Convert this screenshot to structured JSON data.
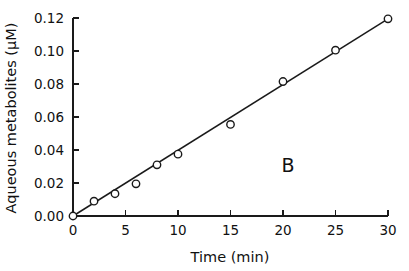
{
  "figure": {
    "panel_label": "B",
    "background_color": "#ffffff",
    "ink_color": "#1a1a1a"
  },
  "chart_data": {
    "type": "scatter",
    "title": "",
    "subtitle": "",
    "xlabel": "Time (min)",
    "ylabel": "Aqueous metabolites (µM)",
    "xlim": [
      0,
      30
    ],
    "ylim": [
      0.0,
      0.12
    ],
    "xticks": [
      0,
      5,
      10,
      15,
      20,
      25,
      30
    ],
    "xticklabels": [
      "0",
      "5",
      "10",
      "15",
      "20",
      "25",
      "30"
    ],
    "yticks": [
      0.0,
      0.02,
      0.04,
      0.06,
      0.08,
      0.1,
      0.12
    ],
    "yticklabels": [
      "0.00",
      "0.02",
      "0.04",
      "0.06",
      "0.08",
      "0.10",
      "0.12"
    ],
    "grid": false,
    "legend": false,
    "legend_position": "none",
    "annotations": [
      {
        "text": "B",
        "x": 22.5,
        "y": 0.0375
      }
    ],
    "series": [
      {
        "name": "Aqueous metabolites",
        "marker": "open-circle",
        "marker_size": 5,
        "color": "#1a1a1a",
        "x": [
          0,
          2,
          4,
          6,
          8,
          10,
          15,
          20,
          25,
          30
        ],
        "values": [
          0.0,
          0.009,
          0.0135,
          0.0195,
          0.031,
          0.0375,
          0.0555,
          0.0815,
          0.1005,
          0.1195
        ]
      },
      {
        "name": "Linear fit",
        "marker": "none",
        "type": "line",
        "color": "#1a1a1a",
        "x": [
          0,
          30
        ],
        "values": [
          0.0,
          0.1195
        ],
        "slope": 0.00398,
        "intercept": 0.0
      }
    ]
  }
}
